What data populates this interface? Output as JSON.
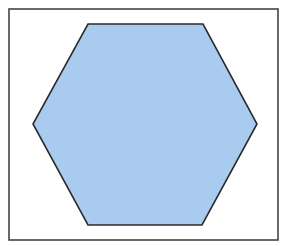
{
  "figure": {
    "width": 283,
    "height": 246,
    "background": "#ffffff",
    "frame": {
      "x": 9,
      "y": 9,
      "width": 269,
      "height": 231,
      "stroke": "#444444",
      "stroke_width": 1.6,
      "fill": "#ffffff"
    },
    "shape": {
      "type": "regular-hexagon",
      "orientation": "flat-top",
      "points": [
        [
          88,
          24
        ],
        [
          203,
          24
        ],
        [
          257,
          124
        ],
        [
          202,
          225
        ],
        [
          88,
          225
        ],
        [
          33,
          124
        ]
      ],
      "fill": "#a9cbef",
      "stroke": "#2b2b2b",
      "stroke_width": 1.6
    }
  }
}
